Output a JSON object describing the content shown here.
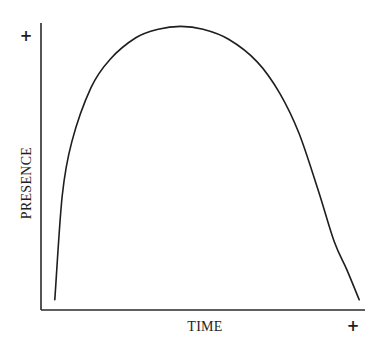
{
  "chart_data": {
    "type": "line",
    "title": "",
    "xlabel": "TIME",
    "ylabel": "PRESENCE",
    "x_end_marker": "+",
    "y_end_marker": "+",
    "xlim": [
      0,
      1
    ],
    "ylim": [
      0,
      1
    ],
    "grid": false,
    "legend": "none",
    "ticks": {
      "x": [],
      "y": []
    },
    "series": [
      {
        "name": "presence",
        "color": "#1e1e1e",
        "x": [
          0.037,
          0.06,
          0.09,
          0.15,
          0.21,
          0.29,
          0.36,
          0.43,
          0.5,
          0.58,
          0.67,
          0.74,
          0.8,
          0.86,
          0.91,
          0.95,
          0.988
        ],
        "y": [
          0.036,
          0.4,
          0.59,
          0.78,
          0.88,
          0.955,
          0.985,
          0.995,
          0.985,
          0.95,
          0.87,
          0.76,
          0.62,
          0.42,
          0.24,
          0.14,
          0.036
        ]
      }
    ]
  }
}
